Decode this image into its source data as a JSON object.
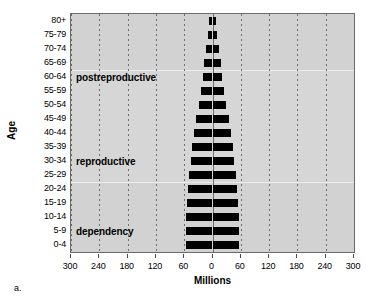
{
  "figure": {
    "caption": "a.",
    "ylabel": "Age",
    "xlabel": "Millions"
  },
  "chart_data": {
    "type": "bar",
    "subtype": "population-pyramid",
    "title": "",
    "xlabel": "Millions",
    "ylabel": "Age",
    "xlim": [
      -300,
      300
    ],
    "xticks": [
      -300,
      -240,
      -180,
      -120,
      -60,
      0,
      60,
      120,
      180,
      240,
      300
    ],
    "xtick_labels": [
      "300",
      "240",
      "180",
      "120",
      "60",
      "0",
      "60",
      "120",
      "180",
      "240",
      "300"
    ],
    "grid": true,
    "grid_style": "dashed-vertical",
    "legend": "none",
    "categories": [
      "0-4",
      "5-9",
      "10-14",
      "15-19",
      "20-24",
      "25-29",
      "30-34",
      "35-39",
      "40-44",
      "45-49",
      "50-54",
      "55-59",
      "60-64",
      "65-69",
      "70-74",
      "75-79",
      "80+"
    ],
    "series": [
      {
        "name": "male",
        "side": "left",
        "values": [
          57,
          57,
          56,
          54,
          52,
          49,
          46,
          44,
          39,
          34,
          29,
          25,
          21,
          17,
          14,
          10,
          8
        ]
      },
      {
        "name": "female",
        "side": "right",
        "values": [
          57,
          57,
          56,
          54,
          52,
          49,
          46,
          44,
          39,
          34,
          29,
          25,
          21,
          17,
          14,
          10,
          8
        ]
      }
    ],
    "annotations": [
      {
        "text": "postreproductive",
        "category_anchor": "60-64"
      },
      {
        "text": "reproductive",
        "category_anchor": "30-34"
      },
      {
        "text": "dependency",
        "category_anchor": "5-9"
      }
    ]
  }
}
